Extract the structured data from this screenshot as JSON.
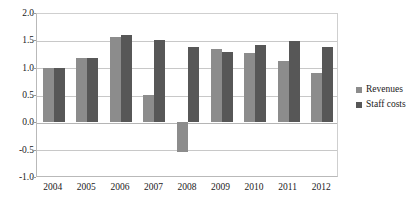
{
  "chart_data": {
    "type": "bar",
    "title": "",
    "subtitle": "",
    "xlabel": "",
    "ylabel": "",
    "categories": [
      "2004",
      "2005",
      "2006",
      "2007",
      "2008",
      "2009",
      "2010",
      "2011",
      "2012"
    ],
    "series": [
      {
        "name": "Revenues",
        "color": "#8c8c8c",
        "values": [
          1.0,
          1.18,
          1.56,
          0.5,
          -0.55,
          1.35,
          1.27,
          1.12,
          0.9
        ]
      },
      {
        "name": "Staff costs",
        "color": "#575757",
        "values": [
          1.0,
          1.17,
          1.59,
          1.5,
          1.38,
          1.29,
          1.42,
          1.49,
          1.38
        ]
      }
    ],
    "ylim": [
      -1.0,
      2.0
    ],
    "yticks": [
      2.0,
      1.5,
      1.0,
      0.5,
      0.0,
      -0.5,
      -1.0
    ],
    "ytick_labels": [
      "2.0",
      "1.5",
      "1.0",
      "0.5",
      "0.0",
      "-0.5",
      "-1.0"
    ],
    "grid": true,
    "grid_axis": "y",
    "legend_position": "right",
    "legend": [
      "Revenues",
      "Staff costs"
    ]
  },
  "axes": {
    "y_labels": [
      "2.0",
      "1.5",
      "1.0",
      "0.5",
      "0.0",
      "-0.5",
      "-1.0"
    ],
    "x_labels": [
      "2004",
      "2005",
      "2006",
      "2007",
      "2008",
      "2009",
      "2010",
      "2011",
      "2012"
    ]
  },
  "legend": {
    "items": [
      {
        "label": "Revenues",
        "color": "#8c8c8c"
      },
      {
        "label": "Staff costs",
        "color": "#575757"
      }
    ]
  }
}
